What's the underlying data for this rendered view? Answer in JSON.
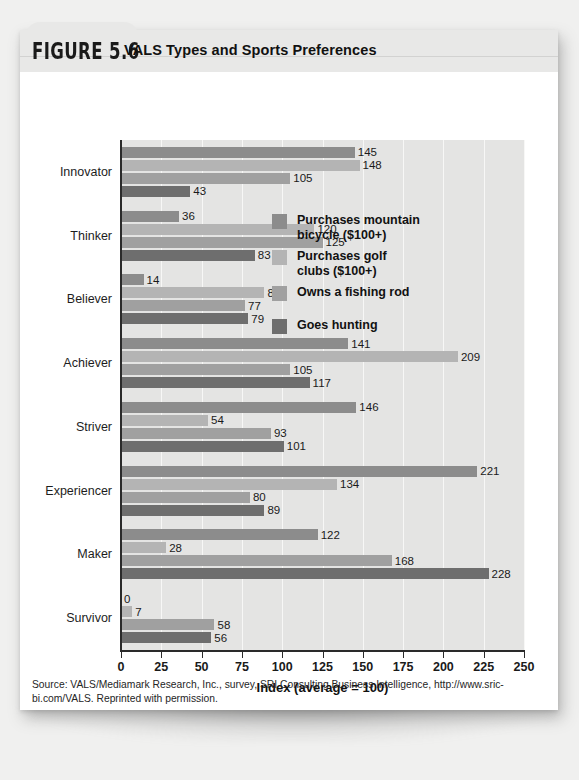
{
  "figure": {
    "number": "FIGURE 5.6",
    "title": "VALS Types and Sports Preferences"
  },
  "source_note": "Source: VALS/Mediamark Research, Inc., survey, SRI Consulting Business Intelligence, http://www.sric-bi.com/VALS. Reprinted with permission.",
  "colors": {
    "series_1": "#8c8c8c",
    "series_2": "#b4b4b4",
    "series_3": "#a0a0a0",
    "series_4": "#6e6e6e",
    "plot_background": "#e4e4e3",
    "gridline": "#f7f7f6",
    "axis": "#2a2a2a",
    "header_band": "#e8e8e7",
    "page": "#ffffff"
  },
  "chart_data": {
    "type": "bar",
    "orientation": "horizontal",
    "title": "VALS Types and Sports Preferences",
    "xlabel": "Index (average = 100)",
    "ylabel": "",
    "xlim": [
      0,
      250
    ],
    "xticks": [
      0,
      25,
      50,
      75,
      100,
      125,
      150,
      175,
      200,
      225,
      250
    ],
    "grid": true,
    "legend_position": "inside-upper-right",
    "categories": [
      "Innovator",
      "Thinker",
      "Believer",
      "Achiever",
      "Striver",
      "Experiencer",
      "Maker",
      "Survivor"
    ],
    "series": [
      {
        "name": "Purchases mountain bicycle ($100+)",
        "color": "#8c8c8c",
        "values": [
          145,
          36,
          14,
          141,
          146,
          221,
          122,
          0
        ]
      },
      {
        "name": "Purchases golf clubs ($100+)",
        "color": "#b4b4b4",
        "values": [
          148,
          120,
          89,
          209,
          54,
          134,
          28,
          7
        ]
      },
      {
        "name": "Owns a fishing rod",
        "color": "#a0a0a0",
        "values": [
          105,
          125,
          77,
          105,
          93,
          80,
          168,
          58
        ]
      },
      {
        "name": "Goes hunting",
        "color": "#6e6e6e",
        "values": [
          43,
          83,
          79,
          117,
          101,
          89,
          228,
          56
        ]
      }
    ]
  },
  "legend": {
    "items": [
      {
        "label_line_1": "Purchases mountain",
        "label_line_2": "bicycle ($100+)",
        "color": "#8c8c8c"
      },
      {
        "label_line_1": "Purchases golf",
        "label_line_2": "clubs ($100+)",
        "color": "#b4b4b4"
      },
      {
        "label_line_1": "Owns a fishing rod",
        "label_line_2": "",
        "color": "#a0a0a0"
      },
      {
        "label_line_1": "Goes hunting",
        "label_line_2": "",
        "color": "#6e6e6e"
      }
    ]
  }
}
